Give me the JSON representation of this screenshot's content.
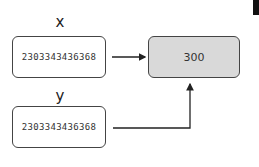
{
  "diagram": {
    "variables": [
      {
        "name": "x",
        "address": "2303343436368"
      },
      {
        "name": "y",
        "address": "2303343436368"
      }
    ],
    "object": {
      "value": "300",
      "fill": "#d9d9d9"
    },
    "arrows": [
      {
        "from": "x",
        "to": "object"
      },
      {
        "from": "y",
        "to": "object"
      }
    ]
  }
}
